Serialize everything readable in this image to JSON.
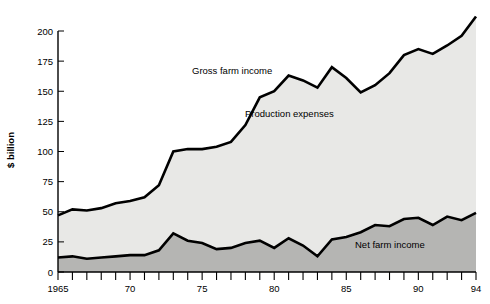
{
  "chart_data": {
    "type": "area",
    "title": "",
    "subtitle": "",
    "xlabel": "",
    "ylabel": "$ billion",
    "xlim": [
      1965,
      1994
    ],
    "ylim": [
      0,
      200
    ],
    "y_ticks": [
      0,
      25,
      50,
      75,
      100,
      125,
      150,
      175,
      200
    ],
    "y_tick_labels": [
      "0",
      "25",
      "50",
      "75",
      "100",
      "125",
      "150",
      "175",
      "200"
    ],
    "x_ticks": [
      1965,
      1966,
      1967,
      1968,
      1969,
      1970,
      1971,
      1972,
      1973,
      1974,
      1975,
      1976,
      1977,
      1978,
      1979,
      1980,
      1981,
      1982,
      1983,
      1984,
      1985,
      1986,
      1987,
      1988,
      1989,
      1990,
      1991,
      1992,
      1993,
      1994
    ],
    "x_tick_labels": [
      {
        "year": 1965,
        "label": "1965"
      },
      {
        "year": 1970,
        "label": "70"
      },
      {
        "year": 1975,
        "label": "75"
      },
      {
        "year": 1980,
        "label": "80"
      },
      {
        "year": 1985,
        "label": "85"
      },
      {
        "year": 1990,
        "label": "90"
      },
      {
        "year": 1994,
        "label": "94"
      }
    ],
    "grid": false,
    "legend_position": "inline-annotations",
    "x": [
      1965,
      1966,
      1967,
      1968,
      1969,
      1970,
      1971,
      1972,
      1973,
      1974,
      1975,
      1976,
      1977,
      1978,
      1979,
      1980,
      1981,
      1982,
      1983,
      1984,
      1985,
      1986,
      1987,
      1988,
      1989,
      1990,
      1991,
      1992,
      1993,
      1994
    ],
    "series": [
      {
        "name": "Gross farm income",
        "label": "Gross farm income",
        "fill_color": "#e8e8e6",
        "line_color": "#000000",
        "values": [
          47,
          52,
          51,
          53,
          57,
          59,
          62,
          72,
          100,
          102,
          102,
          104,
          108,
          122,
          145,
          150,
          163,
          159,
          153,
          170,
          161,
          149,
          155,
          165,
          180,
          185,
          181,
          188,
          196,
          212
        ]
      },
      {
        "name": "Net farm income",
        "label": "Net farm income",
        "fill_color": "#b5b5b3",
        "line_color": "#000000",
        "values": [
          12,
          13,
          11,
          12,
          13,
          14,
          14,
          18,
          32,
          26,
          24,
          19,
          20,
          24,
          26,
          20,
          28,
          22,
          13,
          27,
          29,
          33,
          39,
          38,
          44,
          45,
          39,
          46,
          43,
          49
        ]
      }
    ],
    "annotations": [
      {
        "text": "Gross farm income",
        "series": "Gross farm income"
      },
      {
        "text": "Production expenses",
        "series": "Production expenses band"
      },
      {
        "text": "Net farm income",
        "series": "Net farm income"
      }
    ],
    "bands": [
      {
        "name": "Production expenses",
        "label": "Production expenses",
        "color": "#e8e8e6",
        "between": [
          "Net farm income",
          "Gross farm income"
        ]
      },
      {
        "name": "Net farm income band",
        "label": "Net farm income",
        "color": "#b5b5b3",
        "between": [
          "zero",
          "Net farm income"
        ]
      }
    ]
  },
  "axis": {
    "y_title": "$ billion"
  }
}
